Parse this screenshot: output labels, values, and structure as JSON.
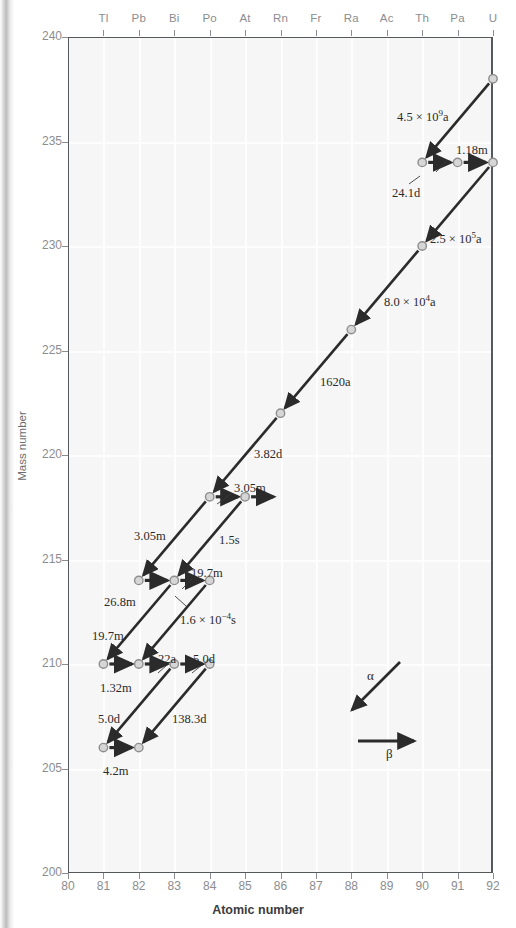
{
  "figure": {
    "xaxis_title": "Atomic number",
    "yaxis_title": "Mass number"
  },
  "chart_data": {
    "type": "scatter",
    "title": "",
    "xlabel": "Atomic number",
    "ylabel": "Mass number",
    "xlim": [
      80,
      92
    ],
    "ylim": [
      200,
      240
    ],
    "grid": true,
    "xticks": [
      "80",
      "81",
      "82",
      "83",
      "84",
      "85",
      "86",
      "87",
      "88",
      "89",
      "90",
      "91",
      "92"
    ],
    "yticks": [
      "200",
      "205",
      "210",
      "215",
      "220",
      "225",
      "230",
      "235",
      "240"
    ],
    "element_symbols": [
      {
        "z": 81,
        "symbol": "Tl"
      },
      {
        "z": 82,
        "symbol": "Pb"
      },
      {
        "z": 83,
        "symbol": "Bi"
      },
      {
        "z": 84,
        "symbol": "Po"
      },
      {
        "z": 85,
        "symbol": "At"
      },
      {
        "z": 86,
        "symbol": "Rn"
      },
      {
        "z": 87,
        "symbol": "Fr"
      },
      {
        "z": 88,
        "symbol": "Ra"
      },
      {
        "z": 89,
        "symbol": "Ac"
      },
      {
        "z": 90,
        "symbol": "Th"
      },
      {
        "z": 91,
        "symbol": "Pa"
      },
      {
        "z": 92,
        "symbol": "U"
      }
    ],
    "nuclides": [
      {
        "z": 92,
        "a": 238
      },
      {
        "z": 90,
        "a": 234
      },
      {
        "z": 91,
        "a": 234
      },
      {
        "z": 92,
        "a": 234
      },
      {
        "z": 90,
        "a": 230
      },
      {
        "z": 88,
        "a": 226
      },
      {
        "z": 86,
        "a": 222
      },
      {
        "z": 84,
        "a": 218
      },
      {
        "z": 85,
        "a": 218
      },
      {
        "z": 82,
        "a": 214
      },
      {
        "z": 83,
        "a": 214
      },
      {
        "z": 84,
        "a": 214
      },
      {
        "z": 81,
        "a": 210
      },
      {
        "z": 82,
        "a": 210
      },
      {
        "z": 83,
        "a": 210
      },
      {
        "z": 84,
        "a": 210
      },
      {
        "z": 81,
        "a": 206
      },
      {
        "z": 82,
        "a": 206
      }
    ],
    "decays": [
      {
        "from": [
          92,
          238
        ],
        "to": [
          90,
          234
        ],
        "type": "alpha",
        "halflife": "4.5 × 10⁹a"
      },
      {
        "from": [
          90,
          234
        ],
        "to": [
          91,
          234
        ],
        "type": "beta",
        "halflife": "24.1d"
      },
      {
        "from": [
          91,
          234
        ],
        "to": [
          92,
          234
        ],
        "type": "beta",
        "halflife": "1.18m"
      },
      {
        "from": [
          92,
          234
        ],
        "to": [
          90,
          230
        ],
        "type": "alpha",
        "halflife": "2.5 × 10⁵a"
      },
      {
        "from": [
          90,
          230
        ],
        "to": [
          88,
          226
        ],
        "type": "alpha",
        "halflife": "8.0 × 10⁴a"
      },
      {
        "from": [
          88,
          226
        ],
        "to": [
          86,
          222
        ],
        "type": "alpha",
        "halflife": "1620a"
      },
      {
        "from": [
          86,
          222
        ],
        "to": [
          84,
          218
        ],
        "type": "alpha",
        "halflife": "3.82d"
      },
      {
        "from": [
          84,
          218
        ],
        "to": [
          85,
          218
        ],
        "type": "beta",
        "halflife": "3.05m"
      },
      {
        "from": [
          85,
          218
        ],
        "to": [
          86,
          218
        ],
        "type": "beta",
        "halflife": ""
      },
      {
        "from": [
          84,
          218
        ],
        "to": [
          82,
          214
        ],
        "type": "alpha",
        "halflife": "3.05m"
      },
      {
        "from": [
          85,
          218
        ],
        "to": [
          83,
          214
        ],
        "type": "alpha",
        "halflife": "1.5s"
      },
      {
        "from": [
          82,
          214
        ],
        "to": [
          83,
          214
        ],
        "type": "beta",
        "halflife": "26.8m"
      },
      {
        "from": [
          83,
          214
        ],
        "to": [
          84,
          214
        ],
        "type": "beta",
        "halflife": "19.7m"
      },
      {
        "from": [
          83,
          214
        ],
        "to": [
          81,
          210
        ],
        "type": "alpha",
        "halflife": "19.7m"
      },
      {
        "from": [
          84,
          214
        ],
        "to": [
          82,
          210
        ],
        "type": "alpha",
        "halflife": "1.6 × 10⁻⁴s"
      },
      {
        "from": [
          81,
          210
        ],
        "to": [
          82,
          210
        ],
        "type": "beta",
        "halflife": "1.32m"
      },
      {
        "from": [
          82,
          210
        ],
        "to": [
          83,
          210
        ],
        "type": "beta",
        "halflife": "22a"
      },
      {
        "from": [
          83,
          210
        ],
        "to": [
          84,
          210
        ],
        "type": "beta",
        "halflife": "5.0d"
      },
      {
        "from": [
          83,
          210
        ],
        "to": [
          81,
          206
        ],
        "type": "alpha",
        "halflife": "5.0d"
      },
      {
        "from": [
          84,
          210
        ],
        "to": [
          82,
          206
        ],
        "type": "alpha",
        "halflife": "138.3d"
      },
      {
        "from": [
          81,
          206
        ],
        "to": [
          82,
          206
        ],
        "type": "beta",
        "halflife": "4.2m"
      }
    ],
    "annotations": [
      {
        "key": "a_4_5e9",
        "text": "4.5 × 10",
        "exp": "9",
        "tail": "a"
      },
      {
        "key": "a_24_1d",
        "text": "24.1d"
      },
      {
        "key": "a_1_18m",
        "text": "1.18m"
      },
      {
        "key": "a_2_5e5",
        "text": "2.5 × 10",
        "exp": "5",
        "tail": "a"
      },
      {
        "key": "a_8_0e4",
        "text": "8.0 × 10",
        "exp": "4",
        "tail": "a"
      },
      {
        "key": "a_1620a",
        "text": "1620a"
      },
      {
        "key": "a_3_82d",
        "text": "3.82d"
      },
      {
        "key": "a_3_05m_top",
        "text": "3.05m"
      },
      {
        "key": "a_1_5s",
        "text": "1.5s"
      },
      {
        "key": "a_3_05m_left",
        "text": "3.05m"
      },
      {
        "key": "a_26_8m",
        "text": "26.8m"
      },
      {
        "key": "a_19_7m_upper",
        "text": "19.7m"
      },
      {
        "key": "a_1_6em4s",
        "text": "1.6 × 10",
        "exp": "−4",
        "tail": "s"
      },
      {
        "key": "a_19_7m_left",
        "text": "19.7m"
      },
      {
        "key": "a_1_32m",
        "text": "1.32m"
      },
      {
        "key": "a_22a",
        "text": "22a"
      },
      {
        "key": "a_5_0d_top",
        "text": "5.0d"
      },
      {
        "key": "a_5_0d_left",
        "text": "5.0d"
      },
      {
        "key": "a_138_3d",
        "text": "138.3d"
      },
      {
        "key": "a_4_2m",
        "text": "4.2m"
      }
    ],
    "legend": {
      "position": "bottom-right",
      "entries": [
        {
          "symbol": "α",
          "meaning": "alpha decay",
          "arrow": "diagonal-down-left"
        },
        {
          "symbol": "β",
          "meaning": "beta decay",
          "arrow": "horizontal-right"
        }
      ]
    }
  },
  "labels": {
    "a_4_5e9_full": "4.5 × 10⁹a",
    "a_24_1d": "24.1d",
    "a_1_18m": "1.18m",
    "a_2_5e5_full": "2.5 × 10⁵a",
    "a_8_0e4_full": "8.0 × 10⁴a",
    "a_1620a": "1620a",
    "a_3_82d": "3.82d",
    "a_3_05m_top": "3.05m",
    "a_1_5s": "1.5s",
    "a_3_05m_left": "3.05m",
    "a_26_8m": "26.8m",
    "a_19_7m_upper": "19.7m",
    "a_1_6em4s_full": "1.6 × 10−4s",
    "a_19_7m_left": "19.7m",
    "a_1_32m": "1.32m",
    "a_22a": "22a",
    "a_5_0d_top": "5.0d",
    "a_5_0d_left": "5.0d",
    "a_138_3d": "138.3d",
    "a_4_2m": "4.2m",
    "alpha": "α",
    "beta": "β"
  }
}
